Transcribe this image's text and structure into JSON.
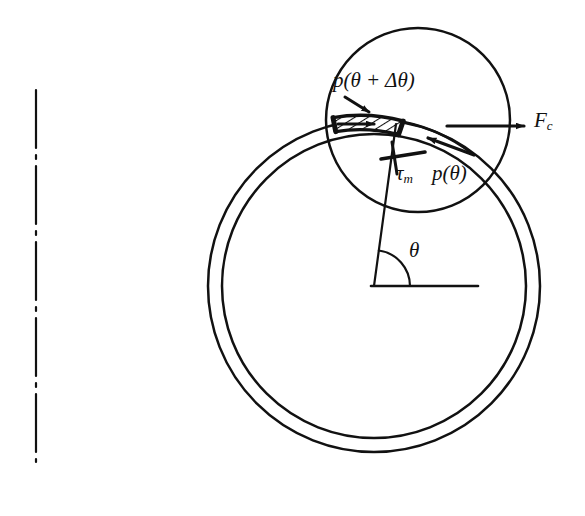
{
  "figure": {
    "background_color": "#ffffff",
    "line_color": "#111111",
    "width": 585,
    "height": 516
  },
  "labels": {
    "pressure_leading": "p(θ + Δθ)",
    "pressure_leading_parts": {
      "symbol": "p",
      "open": "(",
      "theta": "θ",
      "plus": "+",
      "delta": "Δ",
      "theta2": "θ",
      "close": ")"
    },
    "shear_stress": "τ",
    "shear_stress_subscript": "m",
    "pressure_trailing": "p(θ)",
    "centrifugal_force": "F",
    "centrifugal_force_subscript": "c",
    "angle": "θ"
  },
  "geometry": {
    "centerline": {
      "name": "axis-centerline",
      "x": 36,
      "y_top": 90,
      "y_bottom": 462,
      "style": "dash-dot"
    },
    "belt_ring": {
      "center_x": 374,
      "center_y": 286,
      "outer_radius": 166,
      "inner_radius": 152,
      "stroke_width": 2.4
    },
    "pulley": {
      "center_x": 418,
      "center_y": 120,
      "radius": 92,
      "stroke_width": 2.4
    },
    "element": {
      "description": "hatched differential belt element",
      "angle_start_deg": 104,
      "angle_end_deg": 80,
      "hatch_spacing": 7
    },
    "radial_line": {
      "from_x": 374,
      "from_y": 286,
      "to_x": 395,
      "to_y": 124
    },
    "angle_arc": {
      "center_x": 374,
      "center_y": 286,
      "radius": 36,
      "from_deg": 0,
      "to_deg": 82
    },
    "baseline": {
      "x1": 374,
      "y1": 286,
      "x2": 478,
      "y2": 286
    }
  },
  "arrows": [
    {
      "name": "pressure-leading-arrow-upper",
      "label_key": "pressure_leading",
      "x1": 348,
      "y1": 101,
      "x2": 372,
      "y2": 113,
      "direction": "down-right"
    },
    {
      "name": "pressure-leading-arrow-lower",
      "label_key": "pressure_leading",
      "x1": 340,
      "y1": 124,
      "x2": 378,
      "y2": 124,
      "direction": "right"
    },
    {
      "name": "centrifugal-force-arrow",
      "label_key": "centrifugal_force",
      "x1": 450,
      "y1": 126,
      "x2": 524,
      "y2": 126,
      "direction": "right"
    },
    {
      "name": "pressure-trailing-arrow",
      "label_key": "pressure_trailing",
      "x1": 470,
      "y1": 152,
      "x2": 432,
      "y2": 139,
      "direction": "up-left"
    },
    {
      "name": "shear-stress-tick",
      "label_key": "shear_stress",
      "x1": 381,
      "y1": 158,
      "x2": 424,
      "y2": 151,
      "direction": "tick"
    }
  ]
}
